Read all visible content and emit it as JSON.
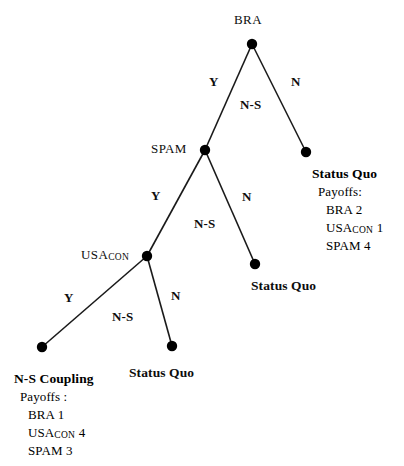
{
  "diagram": {
    "background_color": "#ffffff",
    "line_color": "#1a1a1a",
    "node_color": "#000000"
  },
  "nodes": {
    "root": {
      "label": "BRA",
      "x": 252,
      "y": 44
    },
    "level2": {
      "label": "SPAM",
      "x": 205,
      "y": 150
    },
    "level3": {
      "label": "USA",
      "subscript": "CON",
      "x": 147,
      "y": 256
    },
    "terminal_right": {
      "x": 306,
      "y": 152
    },
    "terminal_mid": {
      "x": 255,
      "y": 264
    },
    "terminal_bottom_mid": {
      "x": 172,
      "y": 346
    },
    "terminal_bottom_left": {
      "x": 42,
      "y": 347
    }
  },
  "edges": {
    "bra_yes": {
      "label": "Y",
      "secondary": "N-S"
    },
    "bra_no": {
      "label": "N"
    },
    "spam_yes": {
      "label": "Y",
      "secondary": "N-S"
    },
    "spam_no": {
      "label": "N"
    },
    "usa_yes": {
      "label": "Y",
      "secondary": "N-S"
    },
    "usa_no": {
      "label": "N"
    }
  },
  "outcomes": {
    "right": {
      "title": "Status Quo",
      "payoffs_label": "Payoffs:",
      "lines": [
        "BRA 2",
        "SPAM 4"
      ],
      "usa_label": "USA",
      "usa_sub": "CON",
      "usa_value": "1"
    },
    "middle": {
      "title": "Status Quo"
    },
    "bottom_middle": {
      "title": "Status Quo"
    },
    "bottom_left": {
      "title": "N-S Coupling",
      "payoffs_label": "Payoffs :",
      "lines": [
        "BRA 1",
        "SPAM  3"
      ],
      "usa_label": "USA",
      "usa_sub": "CON",
      "usa_value": "4"
    }
  }
}
